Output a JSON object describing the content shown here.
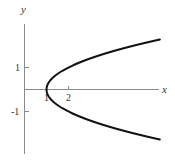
{
  "diagram": {
    "equation_implied": "x = y^2 + 1",
    "axes": {
      "x_label": "x",
      "y_label": "y",
      "x_ticks": [
        {
          "value": 1,
          "label": "1"
        },
        {
          "value": 2,
          "label": "2"
        }
      ],
      "y_ticks": [
        {
          "value": 1,
          "label": "1"
        },
        {
          "value": -1,
          "label": "-1"
        }
      ]
    },
    "curve": {
      "type": "parabola",
      "vertex": [
        1,
        0
      ],
      "opens": "right",
      "y_range": [
        -2.27,
        2.27
      ],
      "color": "#111111"
    },
    "colors": {
      "axis": "#888888",
      "curve": "#111111",
      "background": "#ffffff"
    }
  }
}
